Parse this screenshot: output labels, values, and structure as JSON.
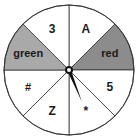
{
  "spinner": {
    "center": [
      69,
      70
    ],
    "radius": 65,
    "sectors": [
      {
        "label": "A",
        "start": -90,
        "end": -45,
        "fill": "#ffffff",
        "font_size": 12
      },
      {
        "label": "red",
        "start": -45,
        "end": 0,
        "fill": "#8c8c8c",
        "font_size": 11
      },
      {
        "label": "5",
        "start": 0,
        "end": 45,
        "fill": "#ffffff",
        "font_size": 12
      },
      {
        "label": "*",
        "start": 45,
        "end": 90,
        "fill": "#ffffff",
        "font_size": 12
      },
      {
        "label": "Z",
        "start": 90,
        "end": 135,
        "fill": "#ffffff",
        "font_size": 12
      },
      {
        "label": "#",
        "start": 135,
        "end": 180,
        "fill": "#ffffff",
        "font_size": 11
      },
      {
        "label": "green",
        "start": 180,
        "end": 225,
        "fill": "#a9a9a9",
        "font_size": 11
      },
      {
        "label": "3",
        "start": 225,
        "end": 270,
        "fill": "#ffffff",
        "font_size": 12
      }
    ],
    "pointer": {
      "tip": [
        82,
        102
      ],
      "color": "#111111"
    },
    "stroke_color": "#333333"
  }
}
